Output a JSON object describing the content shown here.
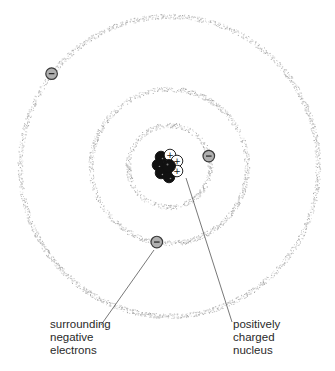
{
  "colors": {
    "orbit": "#b8b8b8",
    "electron_fill": "#b0b0b0",
    "electron_stroke": "#3a3a3a",
    "proton_fill": "#ffffff",
    "neutron_fill": "#111111",
    "leader_line": "#555555",
    "text": "#2a2a2a"
  },
  "orbits": [
    {
      "name": "inner-orbit",
      "shell": 1
    },
    {
      "name": "middle-orbit",
      "shell": 2
    },
    {
      "name": "outer-orbit",
      "shell": 3
    }
  ],
  "electrons": [
    {
      "name": "electron-inner",
      "shell": 1,
      "symbol": "−"
    },
    {
      "name": "electron-middle",
      "shell": 2,
      "symbol": "−"
    },
    {
      "name": "electron-outer",
      "shell": 3,
      "symbol": "−"
    }
  ],
  "nucleus": {
    "particles": [
      {
        "type": "neutron",
        "symbol": ""
      },
      {
        "type": "proton",
        "symbol": "+"
      },
      {
        "type": "proton",
        "symbol": "+"
      },
      {
        "type": "proton",
        "symbol": "+"
      },
      {
        "type": "neutron",
        "symbol": ""
      },
      {
        "type": "neutron",
        "symbol": ""
      },
      {
        "type": "neutron",
        "symbol": ""
      },
      {
        "type": "neutron",
        "symbol": ""
      }
    ]
  },
  "labels": {
    "electrons": [
      "surrounding",
      "negative",
      "electrons"
    ],
    "nucleus": [
      "positively",
      "charged",
      "nucleus"
    ]
  }
}
